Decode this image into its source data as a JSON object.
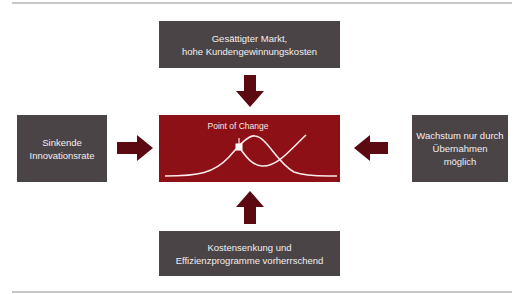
{
  "diagram": {
    "top_box": {
      "text": "Gesättigter Markt,\nhohe Kundengewinnungskosten"
    },
    "left_box": {
      "text": "Sinkende\nInnovationsrate"
    },
    "right_box": {
      "text": "Wachstum nur durch\nÜbernahmen möglich"
    },
    "bottom_box": {
      "text": "Kostensenkung und\nEffizienzprogramme vorherrschend"
    },
    "center": {
      "label": "Point of Change",
      "curves": [
        "bell-curve",
        "s-curve"
      ]
    },
    "arrows": [
      "down",
      "right",
      "left",
      "up"
    ],
    "colors": {
      "box_gray": "#4b4446",
      "center_red": "#8c1016",
      "arrow": "#5a0a10",
      "rule": "#c8c8c8"
    }
  }
}
